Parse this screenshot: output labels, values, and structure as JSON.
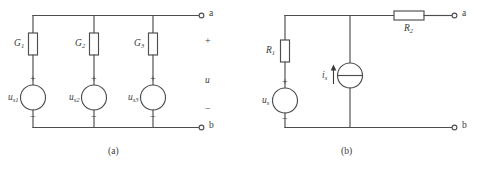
{
  "figure": {
    "type": "electrical-circuit-diagram",
    "background_color": "#ffffff",
    "line_color": "#4d4d4d",
    "text_color": "#3a3a3a",
    "panels": [
      {
        "id": "a",
        "caption": "(a)",
        "description": "Three parallel branches, each a conductance in series with an ideal voltage source, across terminals a-b",
        "terminals": {
          "top": "a",
          "bottom": "b"
        },
        "port_voltage_label": "u",
        "port_plus": "+",
        "port_minus": "−",
        "branches": [
          {
            "conductance_label": "G",
            "conductance_sub": "1",
            "source_label": "u",
            "source_sub": "s1",
            "source_plus": "+",
            "source_minus": "−"
          },
          {
            "conductance_label": "G",
            "conductance_sub": "2",
            "source_label": "u",
            "source_sub": "s2",
            "source_plus": "+",
            "source_minus": "−"
          },
          {
            "conductance_label": "G",
            "conductance_sub": "3",
            "source_label": "u",
            "source_sub": "s3",
            "source_plus": "+",
            "source_minus": "−"
          }
        ]
      },
      {
        "id": "b",
        "caption": "(b)",
        "description": "Voltage source with series resistor R1, a parallel current source, and series resistor R2 to terminal a",
        "terminals": {
          "top": "a",
          "bottom": "b"
        },
        "resistor_series_label": "R",
        "resistor_series_sub": "1",
        "resistor_output_label": "R",
        "resistor_output_sub": "2",
        "voltage_source_label": "u",
        "voltage_source_sub": "s",
        "voltage_source_plus": "+",
        "voltage_source_minus": "−",
        "current_source_label": "i",
        "current_source_sub": "s",
        "current_direction": "up"
      }
    ]
  }
}
